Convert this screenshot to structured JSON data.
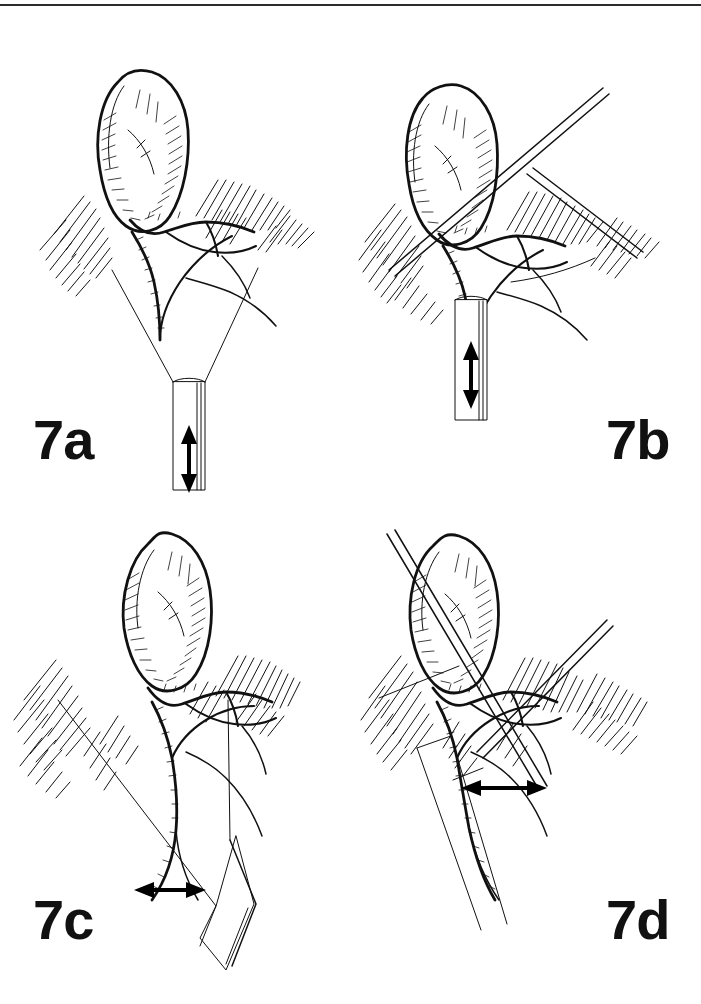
{
  "figure": {
    "background_color": "#ffffff",
    "ink_color": "#111111",
    "top_rule": {
      "present": true,
      "color": "#2b2b2b"
    }
  },
  "panels": [
    {
      "id": "7a",
      "label": "7a",
      "label_position": "bottom-left",
      "arrow": {
        "name": "traction-arrow-vertical",
        "orientation": "vertical",
        "heads": "double",
        "meaning": "up-down traction"
      },
      "instrument": {
        "name": "grasper-shaft",
        "orientation": "vertical",
        "position": "center-bottom"
      },
      "anatomy": [
        "gallbladder",
        "cystic-duct",
        "cystic-artery",
        "common-bile-duct",
        "liver-bed-hatching"
      ]
    },
    {
      "id": "7b",
      "label": "7b",
      "label_position": "bottom-right",
      "arrow": {
        "name": "traction-arrow-vertical",
        "orientation": "vertical",
        "heads": "double",
        "meaning": "up-down traction"
      },
      "instrument": {
        "name": "grasper-shaft",
        "orientation": "vertical",
        "position": "center-bottom"
      },
      "anatomy": [
        "gallbladder",
        "cystic-duct",
        "cystic-artery",
        "common-bile-duct",
        "liver-bed-hatching",
        "dissector-blades"
      ]
    },
    {
      "id": "7c",
      "label": "7c",
      "label_position": "bottom-left",
      "arrow": {
        "name": "traction-arrow-horizontal",
        "orientation": "horizontal",
        "heads": "double",
        "meaning": "lateral traction"
      },
      "instrument": {
        "name": "grasper-shaft",
        "orientation": "oblique",
        "position": "lower-right"
      },
      "anatomy": [
        "gallbladder",
        "cystic-duct",
        "cystic-artery",
        "common-bile-duct",
        "liver-bed-hatching"
      ]
    },
    {
      "id": "7d",
      "label": "7d",
      "label_position": "bottom-right",
      "arrow": {
        "name": "traction-arrow-horizontal",
        "orientation": "horizontal",
        "heads": "double",
        "meaning": "lateral traction"
      },
      "instrument": {
        "name": "grasper-shaft",
        "orientation": "oblique",
        "position": "lower-left"
      },
      "anatomy": [
        "gallbladder",
        "cystic-duct",
        "cystic-artery",
        "common-bile-duct",
        "liver-bed-hatching",
        "dissector-blades"
      ]
    }
  ]
}
